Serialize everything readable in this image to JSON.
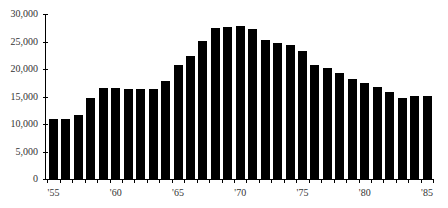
{
  "chart_data": {
    "type": "bar",
    "title": "",
    "xlabel": "",
    "ylabel": "",
    "ylim": [
      0,
      30000
    ],
    "grid": false,
    "legend": null,
    "y_ticks": [
      "0",
      "5,000",
      "10,000",
      "15,000",
      "20,000",
      "25,000",
      "30,000"
    ],
    "x_tick_labels": [
      "'55",
      "'60",
      "'65",
      "'70",
      "'75",
      "'80",
      "'85"
    ],
    "categories": [
      "1955",
      "1956",
      "1957",
      "1958",
      "1959",
      "1960",
      "1961",
      "1962",
      "1963",
      "1964",
      "1965",
      "1966",
      "1967",
      "1968",
      "1969",
      "1970",
      "1971",
      "1972",
      "1973",
      "1974",
      "1975",
      "1976",
      "1977",
      "1978",
      "1979",
      "1980",
      "1981",
      "1982",
      "1983",
      "1984",
      "1985"
    ],
    "values": [
      11000,
      11000,
      11700,
      14800,
      16500,
      16500,
      16300,
      16300,
      16400,
      17800,
      20700,
      22400,
      25100,
      27500,
      27700,
      27900,
      27200,
      25300,
      24800,
      24400,
      23200,
      20800,
      20100,
      19300,
      18100,
      17400,
      16700,
      15900,
      14800,
      15100,
      15100
    ],
    "bar_color": "#000000"
  }
}
